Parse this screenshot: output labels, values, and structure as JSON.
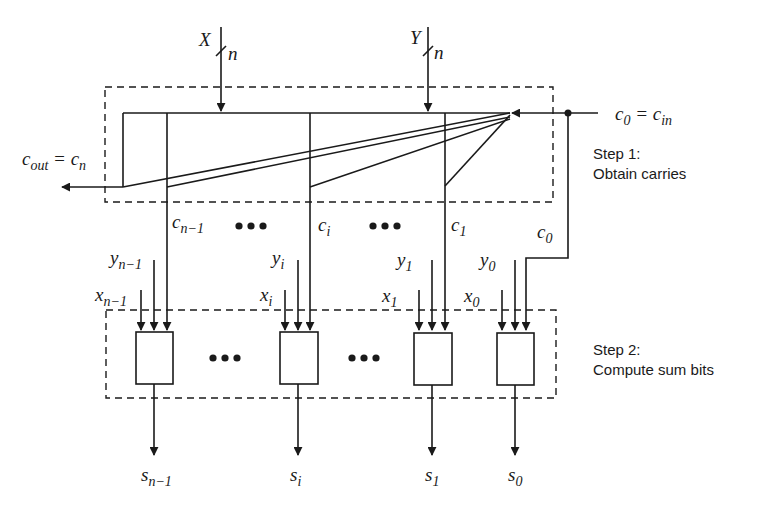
{
  "diagram": {
    "inputs": {
      "x_bus": {
        "name": "X",
        "width": "n"
      },
      "y_bus": {
        "name": "Y",
        "width": "n"
      },
      "carry_in": {
        "lhs": "c",
        "lhs_sub": "0",
        "eq": "=",
        "rhs": "c",
        "rhs_sub": "in"
      }
    },
    "carry_out": {
      "lhs": "c",
      "lhs_sub": "out",
      "eq": "=",
      "rhs": "c",
      "rhs_sub": "n"
    },
    "carries": [
      {
        "base": "c",
        "sub": "n−1"
      },
      {
        "base": "c",
        "sub": "i"
      },
      {
        "base": "c",
        "sub": "1"
      },
      {
        "base": "c",
        "sub": "0"
      }
    ],
    "ellipsis": "•••",
    "steps": [
      {
        "title": "Step 1:",
        "desc": "Obtain carries"
      },
      {
        "title": "Step 2:",
        "desc": "Compute sum bits"
      }
    ],
    "cells": [
      {
        "x": {
          "base": "x",
          "sub": "n−1"
        },
        "y": {
          "base": "y",
          "sub": "n−1"
        },
        "s": {
          "base": "s",
          "sub": "n−1"
        }
      },
      {
        "x": {
          "base": "x",
          "sub": "i"
        },
        "y": {
          "base": "y",
          "sub": "i"
        },
        "s": {
          "base": "s",
          "sub": "i"
        }
      },
      {
        "x": {
          "base": "x",
          "sub": "1"
        },
        "y": {
          "base": "y",
          "sub": "1"
        },
        "s": {
          "base": "s",
          "sub": "1"
        }
      },
      {
        "x": {
          "base": "x",
          "sub": "0"
        },
        "y": {
          "base": "y",
          "sub": "0"
        },
        "s": {
          "base": "s",
          "sub": "0"
        }
      }
    ],
    "colors": {
      "line": "#1a1a1a",
      "background": "#ffffff"
    }
  }
}
